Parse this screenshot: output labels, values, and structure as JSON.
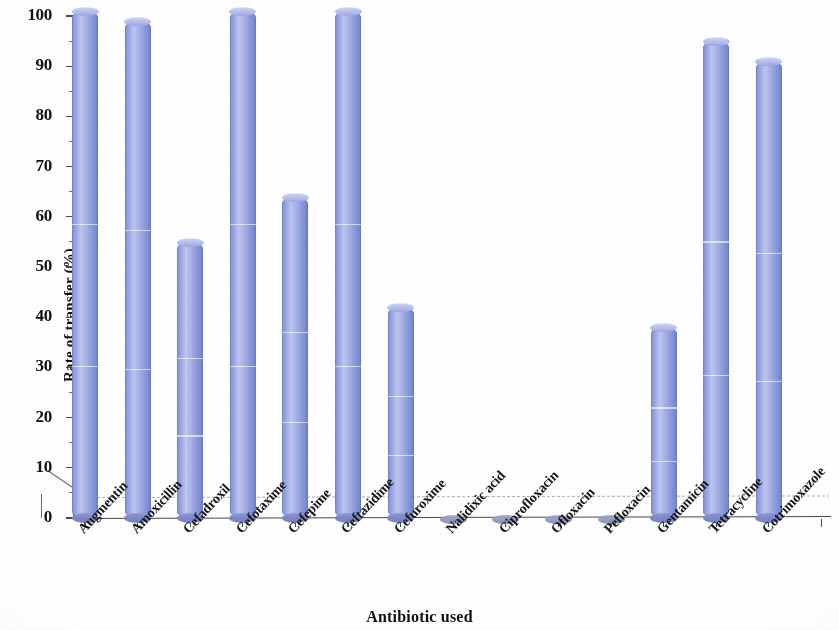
{
  "chart_data": {
    "type": "bar",
    "title": "",
    "subtitle": "",
    "xlabel": "Antibiotic used",
    "ylabel": "Rate of transfer (%)",
    "ylim": [
      0,
      100
    ],
    "yticks": [
      0,
      10,
      20,
      30,
      40,
      50,
      60,
      70,
      80,
      90,
      100
    ],
    "ytick_labels": [
      "0",
      "10",
      "20",
      "30",
      "40",
      "50",
      "60",
      "70",
      "80",
      "90",
      "100"
    ],
    "grid": false,
    "legend": false,
    "legend_position": "none",
    "style": "3d-cylinder",
    "bar_color": "#9BA8E0",
    "bar_edge_color": "#6E7DC6",
    "axis_color": "#4A4A4A",
    "background": "#FFFFFF",
    "categories": [
      "Augmentin",
      "Amoxicillin",
      "Cefadroxil",
      "Cefotaxime",
      "Cefepime",
      "Ceftazidime",
      "Cefuroxime",
      "Nalidixic acid",
      "Ciprofloxacin",
      "Ofloxacin",
      "Pefloxacin",
      "Gentamicin",
      "Tetracycline",
      "Cotrimoxazole"
    ],
    "values": [
      101,
      99,
      55,
      101,
      64,
      101,
      42,
      0,
      0,
      0,
      0,
      38,
      95,
      91
    ],
    "series": [
      {
        "name": "Rate of transfer (%)",
        "values": [
          101,
          99,
          55,
          101,
          64,
          101,
          42,
          0,
          0,
          0,
          0,
          38,
          95,
          91
        ]
      }
    ]
  },
  "figure": {
    "axis_titles": {
      "y": "Rate of transfer (%)",
      "x": "Antibiotic used"
    }
  }
}
